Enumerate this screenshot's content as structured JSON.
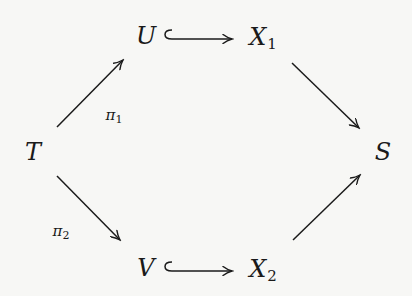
{
  "diagram": {
    "type": "commutative-diagram",
    "background": "#f7f7f5",
    "ink": "#1a1a1a",
    "nodes": {
      "T": {
        "symbol": "T",
        "subscript": ""
      },
      "U": {
        "symbol": "U",
        "subscript": ""
      },
      "V": {
        "symbol": "V",
        "subscript": ""
      },
      "X1": {
        "symbol": "X",
        "subscript": "1"
      },
      "X2": {
        "symbol": "X",
        "subscript": "2"
      },
      "S": {
        "symbol": "S",
        "subscript": ""
      }
    },
    "edges": [
      {
        "from": "T",
        "to": "U",
        "style": "arrow",
        "label": {
          "symbol": "π",
          "subscript": "1"
        }
      },
      {
        "from": "T",
        "to": "V",
        "style": "arrow",
        "label": {
          "symbol": "π",
          "subscript": "2"
        }
      },
      {
        "from": "U",
        "to": "X1",
        "style": "hook-arrow",
        "label": null
      },
      {
        "from": "V",
        "to": "X2",
        "style": "hook-arrow",
        "label": null
      },
      {
        "from": "X1",
        "to": "S",
        "style": "arrow",
        "label": null
      },
      {
        "from": "X2",
        "to": "S",
        "style": "arrow",
        "label": null
      }
    ],
    "labels": {
      "pi1": {
        "symbol": "π",
        "subscript": "1"
      },
      "pi2": {
        "symbol": "π",
        "subscript": "2"
      }
    }
  }
}
